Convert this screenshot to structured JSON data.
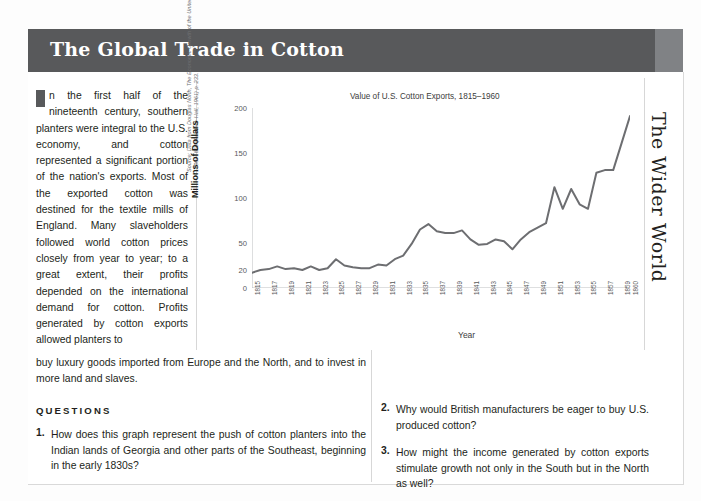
{
  "header": {
    "title": "The Global Trade in Cotton"
  },
  "sidebar": {
    "vertical_label": "The Wider World"
  },
  "article": {
    "intro_dropcap": "I",
    "intro_body": "n the first half of the nineteenth century, southern planters were integral to the U.S. economy, and cotton represented a significant portion of the nation's exports. Most of the exported cotton was destined for the textile mills of England. Many slaveholders followed world cotton prices closely from year to year; to a great extent, their profits depended on the international demand for cotton. Profits generated by cotton exports allowed planters to",
    "continuation": "buy luxury goods imported from Europe and the North, and to invest in more land and slaves."
  },
  "source_credit": {
    "line1": "Source: Data from Douglas North, The Economic Growth of the United States,",
    "line2": "1790–1860 (Prentice-Hall, 1961) p. 233."
  },
  "questions": {
    "heading": "QUESTIONS",
    "items": [
      {
        "number": "1.",
        "text": "How does this graph represent the push of cotton planters into the Indian lands of Georgia and other parts of the Southeast, beginning in the early 1830s?"
      },
      {
        "number": "2.",
        "text": "Why would British manufacturers be eager to buy U.S. produced cotton?"
      },
      {
        "number": "3.",
        "text": "How might the income generated by cotton exports stimulate growth not only in the South but in the North as well?"
      }
    ]
  },
  "colors": {
    "header_bg": "#58595b",
    "edge_bar": "#808285",
    "line_series": "#6d6e71",
    "axis": "#bcbec0",
    "text": "#231f20"
  },
  "chart_data": {
    "type": "line",
    "title": "Value of U.S. Cotton Exports, 1815–1960",
    "xlabel": "Year",
    "ylabel": "Millions of Dollars",
    "ylim": [
      0,
      200
    ],
    "yticks": [
      0,
      20,
      50,
      100,
      150,
      200
    ],
    "grid": false,
    "legend": "none",
    "xlim": [
      1815,
      1860
    ],
    "xticks": [
      "1815",
      "1817",
      "1819",
      "1821",
      "1823",
      "1825",
      "1827",
      "1829",
      "1831",
      "1833",
      "1835",
      "1837",
      "1839",
      "1841",
      "1843",
      "1845",
      "1847",
      "1849",
      "1851",
      "1853",
      "1855",
      "1857",
      "1859",
      "1860"
    ],
    "x": [
      1815,
      1816,
      1817,
      1818,
      1819,
      1820,
      1821,
      1822,
      1823,
      1824,
      1825,
      1826,
      1827,
      1828,
      1829,
      1830,
      1831,
      1832,
      1833,
      1834,
      1835,
      1836,
      1837,
      1838,
      1839,
      1840,
      1841,
      1842,
      1843,
      1844,
      1845,
      1846,
      1847,
      1848,
      1849,
      1850,
      1851,
      1852,
      1853,
      1854,
      1855,
      1856,
      1857,
      1858,
      1859,
      1860
    ],
    "values": [
      17,
      20,
      21,
      24,
      21,
      22,
      20,
      24,
      20,
      22,
      32,
      25,
      23,
      22,
      22,
      26,
      25,
      32,
      36,
      49,
      65,
      71,
      63,
      61,
      61,
      64,
      54,
      48,
      49,
      54,
      52,
      43,
      54,
      62,
      67,
      72,
      112,
      88,
      110,
      93,
      88,
      128,
      131,
      131,
      161,
      191
    ],
    "series": [
      {
        "name": "Value of U.S. Cotton Exports",
        "values": [
          17,
          20,
          21,
          24,
          21,
          22,
          20,
          24,
          20,
          22,
          32,
          25,
          23,
          22,
          22,
          26,
          25,
          32,
          36,
          49,
          65,
          71,
          63,
          61,
          61,
          64,
          54,
          48,
          49,
          54,
          52,
          43,
          54,
          62,
          67,
          72,
          112,
          88,
          110,
          93,
          88,
          128,
          131,
          131,
          161,
          191
        ]
      }
    ]
  }
}
